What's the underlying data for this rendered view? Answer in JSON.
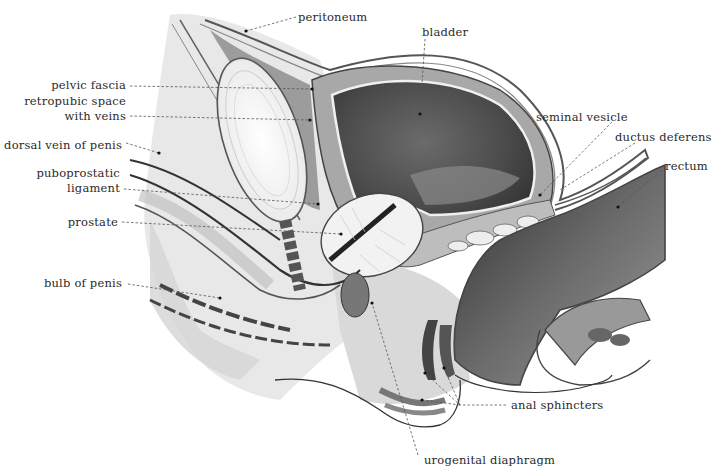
{
  "figure": {
    "type": "anatomical sagittal section",
    "labels": [
      {
        "id": "peritoneum",
        "text": "peritoneum",
        "x": 298,
        "y": 10,
        "align": "left",
        "leader": [
          [
            296,
            17
          ],
          [
            246,
            31
          ]
        ]
      },
      {
        "id": "bladder",
        "text": "bladder",
        "x": 422,
        "y": 25,
        "align": "left",
        "leader": [
          [
            425,
            39
          ],
          [
            420,
            114
          ]
        ]
      },
      {
        "id": "pelvic-fascia",
        "text": "pelvic fascia",
        "x": 58,
        "y": 78,
        "align": "right",
        "right": 126,
        "leader": [
          [
            130,
            86
          ],
          [
            312,
            89
          ]
        ]
      },
      {
        "id": "retropubic-space-1",
        "text": "retropubic space",
        "x": 33,
        "y": 94,
        "align": "right",
        "right": 126
      },
      {
        "id": "retropubic-space-2",
        "text": "with veins",
        "x": 64,
        "y": 109,
        "align": "right",
        "right": 126,
        "leader": [
          [
            130,
            116
          ],
          [
            310,
            120
          ]
        ]
      },
      {
        "id": "seminal-vesicle",
        "text": "seminal vesicle",
        "x": 536,
        "y": 110,
        "align": "left"
      },
      {
        "id": "dorsal-vein",
        "text": "dorsal vein of penis",
        "x": 12,
        "y": 138,
        "align": "right",
        "right": 122,
        "leader": [
          [
            126,
            143
          ],
          [
            159,
            153
          ]
        ]
      },
      {
        "id": "ductus-deferens",
        "text": "ductus deferens",
        "x": 615,
        "y": 130,
        "align": "left",
        "leader": [
          [
            635,
            143
          ],
          [
            540,
            195
          ]
        ]
      },
      {
        "id": "rectum",
        "text": "rectum",
        "x": 665,
        "y": 159,
        "align": "left",
        "leader": [
          [
            662,
            170
          ],
          [
            618,
            207
          ]
        ]
      },
      {
        "id": "puboprostatic-1",
        "text": "puboprostatic",
        "x": 45,
        "y": 166,
        "align": "right",
        "right": 120
      },
      {
        "id": "puboprostatic-2",
        "text": "ligament",
        "x": 73,
        "y": 181,
        "align": "right",
        "right": 120,
        "leader": [
          [
            124,
            189
          ],
          [
            318,
            204
          ]
        ]
      },
      {
        "id": "prostate",
        "text": "prostate",
        "x": 74,
        "y": 215,
        "align": "right",
        "right": 118,
        "leader": [
          [
            122,
            222
          ],
          [
            341,
            234
          ]
        ]
      },
      {
        "id": "bulb-of-penis",
        "text": "bulb of penis",
        "x": 50,
        "y": 276,
        "align": "right",
        "right": 122,
        "leader": [
          [
            128,
            284
          ],
          [
            220,
            298
          ]
        ]
      },
      {
        "id": "anal-sphincters",
        "text": "anal sphincters",
        "x": 511,
        "y": 398,
        "align": "left",
        "leader": [
          [
            506,
            405
          ],
          [
            460,
            405
          ],
          [
            425,
            373
          ]
        ]
      },
      {
        "id": "urogenital-diaphragm",
        "text": "urogenital diaphragm",
        "x": 424,
        "y": 453,
        "align": "left",
        "leader": [
          [
            418,
            455
          ],
          [
            372,
            303
          ]
        ]
      }
    ]
  },
  "colors": {
    "background": "#ffffff",
    "text": "#2a2a2a",
    "dark_tissue": "#3a3a3a",
    "mid_tissue": "#7a7a7a",
    "light_tissue": "#bdbdbd",
    "pale_tissue": "#e2e2e2"
  }
}
